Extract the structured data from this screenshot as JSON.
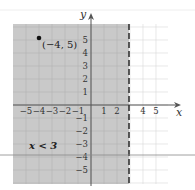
{
  "chart_data": {
    "type": "inequality-graph",
    "title": "",
    "inequality": "x < 3",
    "boundary": {
      "x": 3,
      "style": "dashed",
      "color": "#333333"
    },
    "shaded_region": {
      "side": "left",
      "color": "#c8c8c8"
    },
    "point": {
      "x": -4,
      "y": 5,
      "label": "(−4, 5)"
    },
    "xlabel": "x",
    "ylabel": "y",
    "xlim": [
      -6,
      6
    ],
    "ylim": [
      -6,
      6
    ],
    "x_tick_labels": [
      "−5",
      "−4",
      "−3",
      "−2",
      "−1",
      "1",
      "2",
      "4",
      "5"
    ],
    "x_tick_values": [
      -5,
      -4,
      -3,
      -2,
      -1,
      1,
      2,
      4,
      5
    ],
    "y_tick_labels": [
      "5",
      "4",
      "3",
      "2",
      "1",
      "−1",
      "−2",
      "−3",
      "−4",
      "−5"
    ],
    "y_tick_values": [
      5,
      4,
      3,
      2,
      1,
      -1,
      -2,
      -3,
      -4,
      -5
    ],
    "grid": true,
    "annotation": "x < 3"
  },
  "labels": {
    "x_axis": "x",
    "y_axis": "y",
    "point": "(−4, 5)",
    "inequality": "x < 3"
  }
}
